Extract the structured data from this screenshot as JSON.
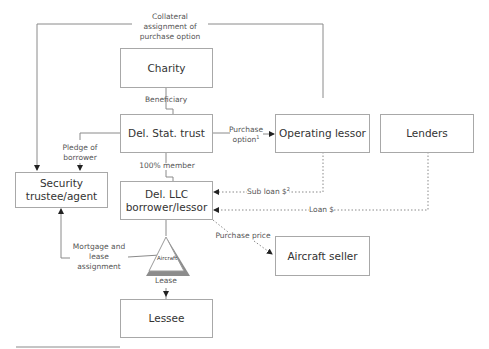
{
  "diagram": {
    "type": "structure-flow",
    "nodes": {
      "charity": "Charity",
      "trust": "Del. Stat. trust",
      "operating_lessor": "Operating lessor",
      "lenders": "Lenders",
      "security_trustee_l1": "Security",
      "security_trustee_l2": "trustee/agent",
      "llc_l1": "Del. LLC",
      "llc_l2": "borrower/lessor",
      "aircraft_seller": "Aircraft seller",
      "lessee": "Lessee",
      "aircraft": "Aircraft"
    },
    "edges": {
      "collateral_l1": "Collateral",
      "collateral_l2": "assignment of",
      "collateral_l3": "purchase option",
      "beneficiary": "Beneficiary",
      "purchase_option_l1": "Purchase",
      "purchase_option_l2": "option",
      "purchase_option_note": "1",
      "pledge_l1": "Pledge of",
      "pledge_l2": "borrower",
      "member": "100% member",
      "sub_loan": "Sub loan $",
      "sub_loan_note": "2",
      "loan": "Loan $",
      "purchase_price": "Purchase price",
      "mortgage_l1": "Mortgage and",
      "mortgage_l2": "lease",
      "mortgage_l3": "assignment",
      "lease": "Lease"
    },
    "colors": {
      "line": "#8a8a8a",
      "box_border": "#a8a8a8",
      "arrow": "#222222",
      "triangle_shadow": "#8c8c8c"
    }
  }
}
